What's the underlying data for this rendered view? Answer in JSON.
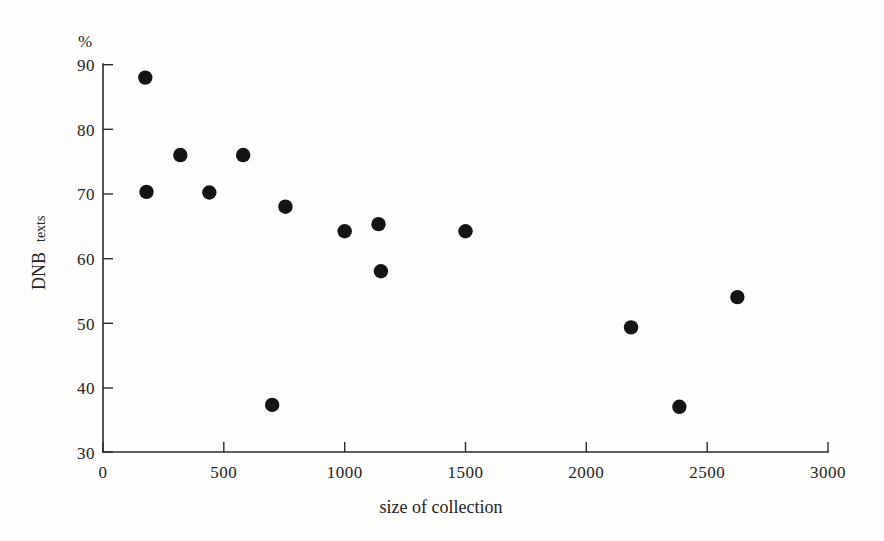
{
  "chart_data": {
    "type": "scatter",
    "title": "",
    "xlabel": "size of collection",
    "ylabel": "DNB texts",
    "ylabel_main": "DNB",
    "ylabel_sub": "texts",
    "yunit": "%",
    "xlim": [
      0,
      3000
    ],
    "ylim": [
      30,
      90
    ],
    "xticks": [
      0,
      500,
      1000,
      1500,
      2000,
      2500,
      3000
    ],
    "xtick_labels": [
      "0",
      "500",
      "1000",
      "1500",
      "2000",
      "2500",
      "3000"
    ],
    "yticks": [
      30,
      40,
      50,
      60,
      70,
      80,
      90
    ],
    "ytick_labels": [
      "30",
      "40",
      "50",
      "60",
      "70",
      "80",
      "90"
    ],
    "grid": false,
    "legend": null,
    "marker": "filled-circle",
    "marker_color": "#141414",
    "points": [
      {
        "x": 175,
        "y": 88.0
      },
      {
        "x": 180,
        "y": 70.3
      },
      {
        "x": 320,
        "y": 76.0
      },
      {
        "x": 440,
        "y": 70.2
      },
      {
        "x": 580,
        "y": 76.0
      },
      {
        "x": 700,
        "y": 37.3
      },
      {
        "x": 755,
        "y": 68.0
      },
      {
        "x": 1000,
        "y": 64.2
      },
      {
        "x": 1140,
        "y": 65.3
      },
      {
        "x": 1150,
        "y": 58.0
      },
      {
        "x": 1500,
        "y": 64.2
      },
      {
        "x": 2185,
        "y": 49.3
      },
      {
        "x": 2385,
        "y": 37.0
      },
      {
        "x": 2625,
        "y": 54.0
      }
    ]
  },
  "colors": {
    "axis": "#2b2b2b",
    "marker": "#141414",
    "text": "#232323",
    "background": "#fdfdfc"
  }
}
